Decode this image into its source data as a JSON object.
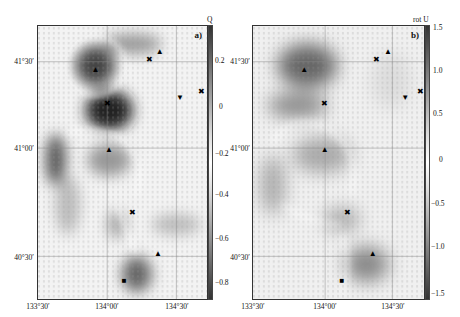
{
  "figure": {
    "panels": [
      {
        "id": "a",
        "label": "a)",
        "colorbar": {
          "title": "Q",
          "ticks": [
            "0.2",
            "0",
            "−0.2",
            "−0.4",
            "−0.6",
            "−0.8"
          ],
          "range": [
            -0.85,
            0.35
          ]
        },
        "y_ticks": [
          "41°30′",
          "41°00′",
          "40°30′"
        ],
        "x_ticks": [
          "133°30′",
          "134°00′",
          "134°30′"
        ],
        "markers": [
          {
            "type": "triangle-up",
            "glyph": "▲",
            "lon_frac": 0.34,
            "lat_frac": 0.16
          },
          {
            "type": "x",
            "glyph": "✖",
            "lon_frac": 0.66,
            "lat_frac": 0.125
          },
          {
            "type": "triangle-up",
            "glyph": "▲",
            "lon_frac": 0.72,
            "lat_frac": 0.095
          },
          {
            "type": "triangle-down",
            "glyph": "▼",
            "lon_frac": 0.84,
            "lat_frac": 0.265
          },
          {
            "type": "x",
            "glyph": "✖",
            "lon_frac": 0.97,
            "lat_frac": 0.24
          },
          {
            "type": "x",
            "glyph": "✖",
            "lon_frac": 0.41,
            "lat_frac": 0.285
          },
          {
            "type": "triangle-up",
            "glyph": "▲",
            "lon_frac": 0.42,
            "lat_frac": 0.455
          },
          {
            "type": "x",
            "glyph": "✖",
            "lon_frac": 0.56,
            "lat_frac": 0.685
          },
          {
            "type": "triangle-up",
            "glyph": "▲",
            "lon_frac": 0.71,
            "lat_frac": 0.835
          },
          {
            "type": "square",
            "glyph": "■",
            "lon_frac": 0.51,
            "lat_frac": 0.935
          }
        ]
      },
      {
        "id": "b",
        "label": "b)",
        "colorbar": {
          "title": "rot U",
          "ticks": [
            "1.5",
            "1.0",
            "0.5",
            "0",
            "−0.5",
            "−1.0",
            "−1.5"
          ],
          "range": [
            -1.5,
            1.5
          ]
        },
        "y_ticks": [
          "41°30′",
          "41°00′",
          "40°30′"
        ],
        "x_ticks": [
          "133°30′",
          "134°00′",
          "134°30′"
        ],
        "markers": [
          {
            "type": "triangle-up",
            "glyph": "▲",
            "lon_frac": 0.3,
            "lat_frac": 0.16
          },
          {
            "type": "x",
            "glyph": "✖",
            "lon_frac": 0.72,
            "lat_frac": 0.125
          },
          {
            "type": "triangle-up",
            "glyph": "▲",
            "lon_frac": 0.79,
            "lat_frac": 0.095
          },
          {
            "type": "triangle-down",
            "glyph": "▼",
            "lon_frac": 0.89,
            "lat_frac": 0.265
          },
          {
            "type": "x",
            "glyph": "✖",
            "lon_frac": 0.98,
            "lat_frac": 0.24
          },
          {
            "type": "x",
            "glyph": "✖",
            "lon_frac": 0.42,
            "lat_frac": 0.285
          },
          {
            "type": "triangle-up",
            "glyph": "▲",
            "lon_frac": 0.42,
            "lat_frac": 0.455
          },
          {
            "type": "x",
            "glyph": "✖",
            "lon_frac": 0.55,
            "lat_frac": 0.685
          },
          {
            "type": "triangle-up",
            "glyph": "▲",
            "lon_frac": 0.7,
            "lat_frac": 0.835
          },
          {
            "type": "square",
            "glyph": "■",
            "lon_frac": 0.52,
            "lat_frac": 0.935
          }
        ]
      }
    ]
  },
  "chart_data": [
    {
      "type": "heatmap",
      "title": "a)",
      "colorbar_label": "Q",
      "colorbar_ticks": [
        0.2,
        0,
        -0.2,
        -0.4,
        -0.6,
        -0.8
      ],
      "xlabel": "",
      "ylabel": "",
      "x_ticks": [
        "133°30′",
        "134°00′",
        "134°30′"
      ],
      "y_ticks": [
        "41°30′",
        "41°00′",
        "40°30′"
      ],
      "overlay": "velocity vector field",
      "grid": true
    },
    {
      "type": "heatmap",
      "title": "b)",
      "colorbar_label": "rot U",
      "colorbar_ticks": [
        1.5,
        1.0,
        0.5,
        0,
        -0.5,
        -1.0,
        -1.5
      ],
      "xlabel": "",
      "ylabel": "",
      "x_ticks": [
        "133°30′",
        "134°00′",
        "134°30′"
      ],
      "y_ticks": [
        "41°30′",
        "41°00′",
        "40°30′"
      ],
      "overlay": "velocity vector field",
      "grid": true
    }
  ]
}
